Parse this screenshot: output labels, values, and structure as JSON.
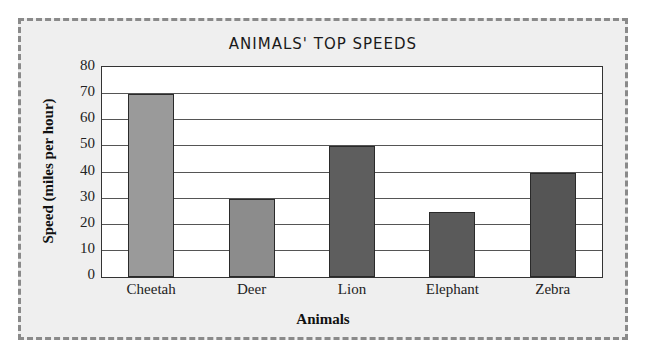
{
  "chart_data": {
    "type": "bar",
    "title": "ANIMALS' TOP SPEEDS",
    "xlabel": "Animals",
    "ylabel": "Speed (miles per hour)",
    "categories": [
      "Cheetah",
      "Deer",
      "Lion",
      "Elephant",
      "Zebra"
    ],
    "values": [
      70,
      30,
      50,
      25,
      40
    ],
    "colors": [
      "#9a9a9a",
      "#8c8c8c",
      "#5e5e5e",
      "#5a5a5a",
      "#555555"
    ],
    "ylim": [
      0,
      80
    ],
    "yticks": [
      0,
      10,
      20,
      30,
      40,
      50,
      60,
      70,
      80
    ],
    "grid": true,
    "legend": null
  },
  "labels": {
    "title": "ANIMALS' TOP SPEEDS",
    "xlabel": "Animals",
    "ylabel": "Speed (miles per hour)",
    "yticks": [
      "0",
      "10",
      "20",
      "30",
      "40",
      "50",
      "60",
      "70",
      "80"
    ],
    "categories": [
      "Cheetah",
      "Deer",
      "Lion",
      "Elephant",
      "Zebra"
    ]
  }
}
